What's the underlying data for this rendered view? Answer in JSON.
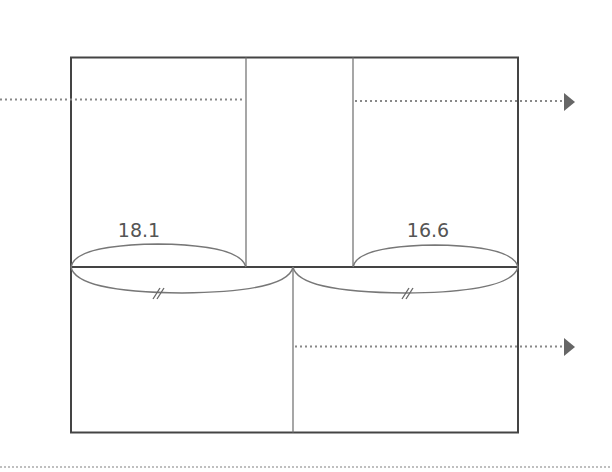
{
  "diagram": {
    "labels": {
      "top_left_width": "18.1",
      "top_right_width": "16.6",
      "bottom_left_mark": "//",
      "bottom_right_mark": "//"
    },
    "colors": {
      "outline": "#444444",
      "inner_line": "#777777",
      "dotted": "#888888",
      "arrowhead": "#666666",
      "label": "#555555"
    },
    "arrows": [
      {
        "name": "top-left-dotted-line",
        "y": 100,
        "has_head": false
      },
      {
        "name": "top-right-dotted-arrow",
        "y": 100,
        "has_head": true
      },
      {
        "name": "bottom-right-dotted-arrow",
        "y": 347,
        "has_head": true
      }
    ]
  }
}
